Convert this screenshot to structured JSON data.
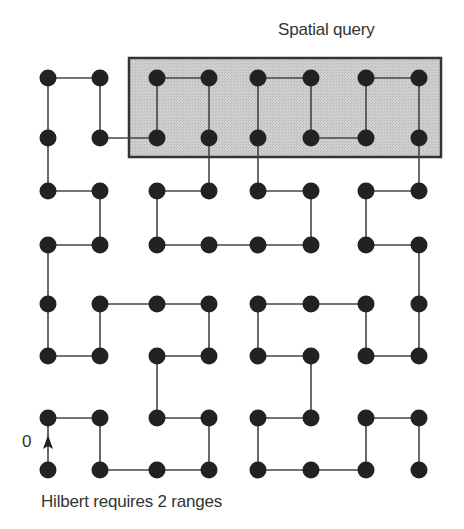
{
  "query_label": "Spatial query",
  "caption": "Hilbert requires 2 ranges",
  "origin_label": "0",
  "colors": {
    "node": "#222222",
    "edge": "#444444",
    "query_fill": "#c8c8c8",
    "query_border": "#333333",
    "text": "#333333"
  },
  "grid": {
    "cols": 8,
    "rows": 8,
    "col_x": [
      48,
      100,
      157,
      209,
      258,
      311,
      366,
      419
    ],
    "row_y": [
      78,
      138,
      191,
      245,
      304,
      356,
      418,
      470
    ],
    "node_radius": 8.5
  },
  "query_box": {
    "x": 129,
    "y": 58,
    "width": 312,
    "height": 99,
    "covers_cols": [
      2,
      7
    ],
    "covers_rows": [
      0,
      1
    ]
  },
  "curve_order": [
    [
      0,
      7
    ],
    [
      0,
      6
    ],
    [
      1,
      6
    ],
    [
      1,
      7
    ],
    [
      2,
      7
    ],
    [
      3,
      7
    ],
    [
      3,
      6
    ],
    [
      2,
      6
    ],
    [
      2,
      5
    ],
    [
      3,
      5
    ],
    [
      3,
      4
    ],
    [
      2,
      4
    ],
    [
      1,
      4
    ],
    [
      1,
      5
    ],
    [
      0,
      5
    ],
    [
      0,
      4
    ],
    [
      0,
      3
    ],
    [
      1,
      3
    ],
    [
      1,
      2
    ],
    [
      0,
      2
    ],
    [
      0,
      1
    ],
    [
      0,
      0
    ],
    [
      1,
      0
    ],
    [
      1,
      1
    ],
    [
      2,
      1
    ],
    [
      2,
      0
    ],
    [
      3,
      0
    ],
    [
      3,
      1
    ],
    [
      3,
      2
    ],
    [
      2,
      2
    ],
    [
      2,
      3
    ],
    [
      3,
      3
    ],
    [
      4,
      3
    ],
    [
      5,
      3
    ],
    [
      5,
      2
    ],
    [
      4,
      2
    ],
    [
      4,
      1
    ],
    [
      4,
      0
    ],
    [
      5,
      0
    ],
    [
      5,
      1
    ],
    [
      6,
      1
    ],
    [
      6,
      0
    ],
    [
      7,
      0
    ],
    [
      7,
      1
    ],
    [
      7,
      2
    ],
    [
      6,
      2
    ],
    [
      6,
      3
    ],
    [
      7,
      3
    ],
    [
      7,
      4
    ],
    [
      7,
      5
    ],
    [
      6,
      5
    ],
    [
      6,
      4
    ],
    [
      5,
      4
    ],
    [
      4,
      4
    ],
    [
      4,
      5
    ],
    [
      5,
      5
    ],
    [
      5,
      6
    ],
    [
      4,
      6
    ],
    [
      4,
      7
    ],
    [
      5,
      7
    ],
    [
      6,
      7
    ],
    [
      6,
      6
    ],
    [
      7,
      6
    ],
    [
      7,
      7
    ]
  ],
  "start_arrow": {
    "from": [
      0,
      7
    ],
    "to": [
      0,
      6
    ]
  }
}
